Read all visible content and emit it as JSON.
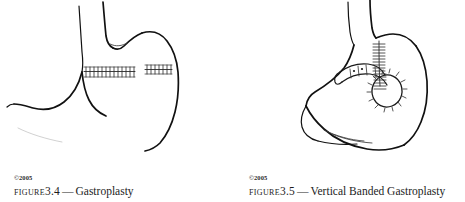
{
  "page": {
    "background_color": "#ffffff",
    "ink_color": "#111111",
    "width": 465,
    "height": 202
  },
  "figures": [
    {
      "id": "figure-3-4",
      "copyright": "©2005",
      "label": "Figure",
      "number": "3.4",
      "dash": "—",
      "title": "Gastroplasty",
      "caption_full": "Figure 3.4 — Gastroplasty",
      "illustration": {
        "subject": "stomach",
        "view": "anterior line drawing",
        "features": [
          "esophagus",
          "cardiac notch",
          "fundus",
          "gastric body",
          "greater curvature",
          "lesser curvature",
          "pylorus",
          "duodenum",
          "horizontal staple line"
        ],
        "staple_lines": [
          {
            "name": "horizontal-staple-line-medial",
            "orientation": "horizontal",
            "tick_count": 13
          },
          {
            "name": "horizontal-staple-line-lateral",
            "orientation": "horizontal",
            "tick_count": 7
          }
        ]
      }
    },
    {
      "id": "figure-3-5",
      "copyright": "©2005",
      "label": "Figure",
      "number": "3.5",
      "dash": "—",
      "title": "Vertical Banded Gastroplasty",
      "caption_full": "Figure 3.5 — Vertical Banded Gastroplasty",
      "illustration": {
        "subject": "stomach",
        "view": "anterior line drawing",
        "features": [
          "esophagus",
          "cardiac notch",
          "fundus",
          "gastric pouch",
          "gastric body",
          "greater curvature",
          "lesser curvature",
          "pylorus",
          "duodenum",
          "vertical staple line",
          "restrictive band",
          "stoma"
        ],
        "staple_lines": [
          {
            "name": "vertical-staple-line",
            "orientation": "vertical",
            "tick_count": 16
          }
        ],
        "band": {
          "name": "restrictive-band",
          "description": "band encircling the outlet below the pouch"
        },
        "stoma": {
          "name": "stoma-opening",
          "description": "small outlet ringed with radiating marks"
        }
      }
    }
  ]
}
